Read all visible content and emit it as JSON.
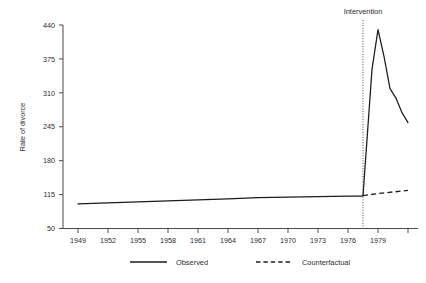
{
  "chart_data": {
    "type": "line",
    "title": "",
    "xlabel": "",
    "ylabel": "Rate of divorce",
    "xlim": [
      1947.5,
      1983.0
    ],
    "ylim": [
      50,
      440
    ],
    "grid": false,
    "legend_position": "bottom",
    "y_ticks": [
      50,
      115,
      180,
      245,
      310,
      375,
      440
    ],
    "x_ticks": [
      1949,
      1952,
      1955,
      1958,
      1961,
      1964,
      1967,
      1970,
      1973,
      1976,
      1979,
      1982
    ],
    "x_tick_labels": [
      "1949",
      "1952",
      "1955",
      "1958",
      "1961",
      "1964",
      "1967",
      "1970",
      "1973",
      "1976",
      "1979",
      ""
    ],
    "y_tick_labels": [
      "50",
      "115",
      "180",
      "245",
      "310",
      "375",
      "440"
    ],
    "annotations": [
      {
        "name": "intervention",
        "label": "Intervention",
        "x": 1977.5,
        "style": "dotted-vertical-line"
      }
    ],
    "series": [
      {
        "name": "Observed",
        "style": "solid",
        "color": "#1c1c1c",
        "x": [
          1949,
          1952,
          1955,
          1958,
          1961,
          1964,
          1967,
          1970,
          1973,
          1976,
          1977.4,
          1977.5,
          1978.4,
          1979.0,
          1979.6,
          1980.2,
          1980.8,
          1981.4,
          1982.0
        ],
        "y": [
          97,
          99,
          101,
          103,
          105,
          107,
          109,
          110,
          111,
          112,
          112,
          113,
          355,
          431,
          380,
          318,
          300,
          272,
          253
        ]
      },
      {
        "name": "Counterfactual",
        "style": "dashed",
        "color": "#1c1c1c",
        "x": [
          1977.5,
          1979.0,
          1980.5,
          1982.0
        ],
        "y": [
          113,
          117,
          120,
          123
        ]
      }
    ]
  },
  "legend": {
    "entries": [
      {
        "label": "Observed",
        "style": "solid"
      },
      {
        "label": "Counterfactual",
        "style": "dashed"
      }
    ]
  }
}
